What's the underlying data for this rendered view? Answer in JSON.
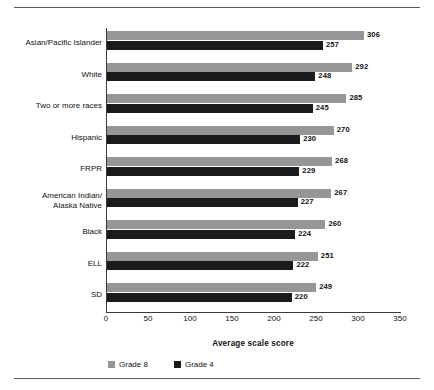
{
  "chart_data": {
    "type": "bar",
    "orientation": "horizontal",
    "title": "",
    "xlabel": "Average scale score",
    "ylabel": "",
    "xlim": [
      0,
      350
    ],
    "xticks": [
      0,
      50,
      100,
      150,
      200,
      250,
      300,
      350
    ],
    "grid": false,
    "legend_position": "bottom-left",
    "categories": [
      "Asian/Pacific Islander",
      "White",
      "Two or more races",
      "Hispanic",
      "FRPR",
      "American Indian/\nAlaska Native",
      "Black",
      "ELL",
      "SD"
    ],
    "series": [
      {
        "name": "Grade 8",
        "color": "#969696",
        "values": [
          306,
          292,
          285,
          270,
          268,
          267,
          260,
          251,
          249
        ]
      },
      {
        "name": "Grade 4",
        "color": "#1b1b1b",
        "values": [
          257,
          248,
          245,
          230,
          229,
          227,
          224,
          222,
          220
        ]
      }
    ]
  },
  "legend": {
    "items": [
      {
        "label": "Grade 8",
        "color": "#969696"
      },
      {
        "label": "Grade 4",
        "color": "#1b1b1b"
      }
    ]
  },
  "axis": {
    "x_title": "Average scale score"
  }
}
